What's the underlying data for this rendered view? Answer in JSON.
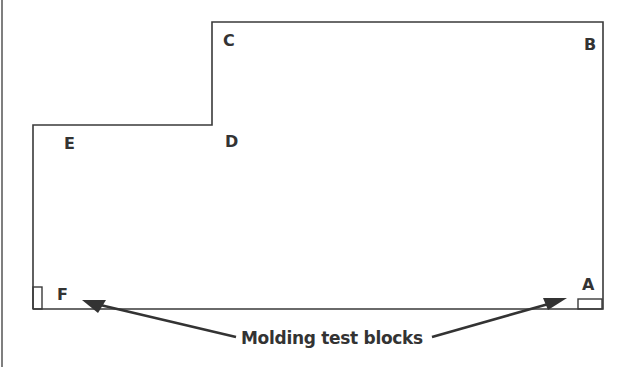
{
  "diagram": {
    "stroke_color": "#3a3a3a",
    "corners": [
      {
        "id": "A",
        "label": "A"
      },
      {
        "id": "B",
        "label": "B"
      },
      {
        "id": "C",
        "label": "C"
      },
      {
        "id": "D",
        "label": "D"
      },
      {
        "id": "E",
        "label": "E"
      },
      {
        "id": "F",
        "label": "F"
      }
    ],
    "caption": "Molding test blocks"
  }
}
